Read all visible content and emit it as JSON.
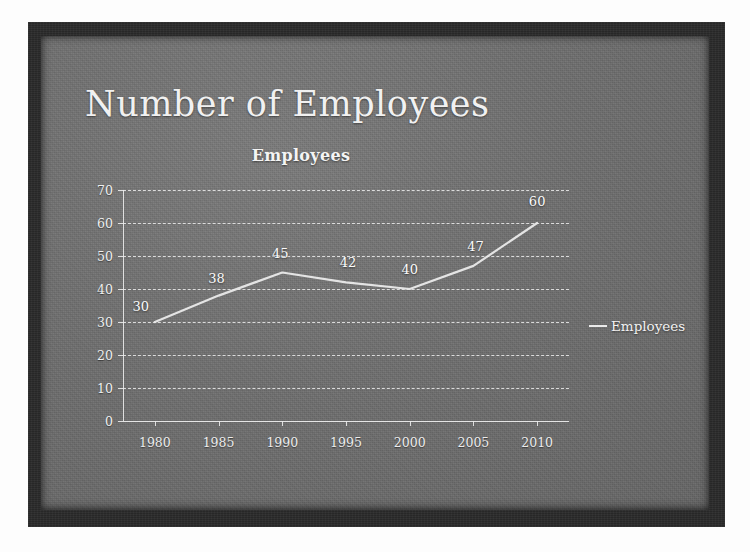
{
  "slide": {
    "title": "Number of Employees",
    "background_color": "#6f6f6f",
    "frame_color": "#2b2b2b",
    "text_color": "#f1f1f1"
  },
  "chart_data": {
    "type": "line",
    "title": "Employees",
    "xlabel": "",
    "ylabel": "",
    "categories": [
      "1980",
      "1985",
      "1990",
      "1995",
      "2000",
      "2005",
      "2010"
    ],
    "series": [
      {
        "name": "Employees",
        "values": [
          30,
          38,
          45,
          42,
          40,
          47,
          60
        ],
        "color": "#eaeaea"
      }
    ],
    "data_labels": [
      "30",
      "38",
      "45",
      "42",
      "40",
      "47",
      "60"
    ],
    "ylim": [
      0,
      70
    ],
    "ytick_labels": [
      "70",
      "60",
      "50",
      "40",
      "30",
      "20",
      "10",
      "0"
    ],
    "ytick_values": [
      70,
      60,
      50,
      40,
      30,
      20,
      10,
      0
    ],
    "grid": true,
    "legend_position": "right",
    "legend_entries": [
      "Employees"
    ]
  }
}
